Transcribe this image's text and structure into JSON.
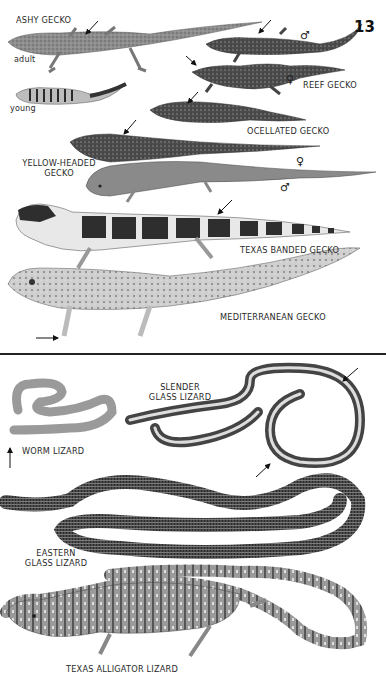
{
  "page": {
    "number": "13",
    "sections": [
      {
        "name": "geckos",
        "species": [
          {
            "label": "ASHY GECKO",
            "sub_labels": [
              "adult",
              "young"
            ]
          },
          {
            "label": "REEF GECKO",
            "sex_symbols": [
              "♂",
              "♀"
            ]
          },
          {
            "label": "OCELLATED GECKO"
          },
          {
            "label_line1": "YELLOW-HEADED",
            "label_line2": "GECKO",
            "sex_symbols": [
              "♀",
              "♂"
            ]
          },
          {
            "label": "TEXAS BANDED GECKO"
          },
          {
            "label": "MEDITERRANEAN GECKO"
          }
        ]
      },
      {
        "name": "legless-and-alligator-lizards",
        "species": [
          {
            "label_line1": "SLENDER",
            "label_line2": "GLASS LIZARD"
          },
          {
            "label": "WORM LIZARD"
          },
          {
            "label_line1": "EASTERN",
            "label_line2": "GLASS LIZARD"
          },
          {
            "label": "TEXAS ALLIGATOR LIZARD"
          }
        ]
      }
    ]
  },
  "colors": {
    "ink": "#222222",
    "background": "#ffffff",
    "gecko_gray": "#8a8a8a",
    "dark_band": "#3a3a3a",
    "light_skin": "#c8c8c8"
  }
}
